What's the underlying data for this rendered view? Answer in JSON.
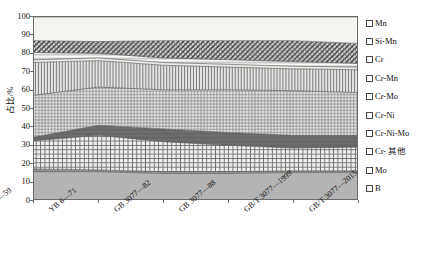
{
  "chart_data": {
    "type": "area",
    "stacked": true,
    "title": "",
    "xlabel": "",
    "ylabel": "占比/%",
    "ylim": [
      0,
      100
    ],
    "yticks": [
      0,
      10,
      20,
      30,
      40,
      50,
      60,
      70,
      80,
      90,
      100
    ],
    "grid": false,
    "legend_position": "right",
    "categories": [
      "YB 6—59",
      "YB 6—71",
      "GB 3077—82",
      "GB 3077—88",
      "GB/T 3077—1999",
      "GB/T 3077—2015"
    ],
    "series": [
      {
        "name": "Mn",
        "values": [
          13.0,
          13.5,
          13.0,
          13.0,
          13.0,
          14.5
        ]
      },
      {
        "name": "Si-Mn",
        "values": [
          6.5,
          6.5,
          9.5,
          10.5,
          11.5,
          11.0
        ]
      },
      {
        "name": "Cr",
        "values": [
          4.0,
          2.5,
          2.5,
          2.5,
          2.5,
          2.0
        ]
      },
      {
        "name": "Cr-Mn",
        "values": [
          1.5,
          1.5,
          1.5,
          1.5,
          1.5,
          1.5
        ]
      },
      {
        "name": "Cr-Mo",
        "values": [
          18.0,
          14.5,
          13.5,
          12.5,
          12.0,
          12.5
        ]
      },
      {
        "name": "Cr-Ni",
        "values": [
          23.0,
          21.0,
          21.5,
          23.5,
          24.5,
          23.5
        ]
      },
      {
        "name": "Cr-Ni-Mo",
        "values": [
          2.0,
          5.5,
          7.0,
          7.0,
          7.0,
          6.5
        ]
      },
      {
        "name": "Cr-其他",
        "values": [
          15.5,
          19.0,
          16.5,
          14.5,
          12.5,
          13.0
        ]
      },
      {
        "name": "Mo",
        "values": [
          1.5,
          1.0,
          1.0,
          1.0,
          1.0,
          1.0
        ]
      },
      {
        "name": "B",
        "values": [
          15.0,
          15.0,
          14.0,
          14.0,
          14.5,
          14.5
        ]
      }
    ],
    "cumulative_tops": {
      "B": [
        15.0,
        15.0,
        14.0,
        14.0,
        14.5,
        14.5
      ],
      "Mo": [
        16.5,
        16.0,
        15.0,
        15.0,
        15.5,
        15.5
      ],
      "Cr-其他": [
        32.0,
        35.0,
        31.5,
        29.5,
        28.0,
        28.5
      ],
      "Cr-Ni-Mo": [
        34.0,
        40.5,
        38.5,
        36.5,
        35.0,
        35.0
      ],
      "Cr-Ni": [
        57.0,
        61.5,
        60.0,
        60.0,
        59.5,
        58.5
      ],
      "Cr-Mo": [
        75.0,
        76.0,
        73.5,
        72.5,
        71.5,
        71.0
      ],
      "Cr-Mn": [
        76.5,
        77.5,
        75.0,
        74.0,
        73.0,
        72.5
      ],
      "Cr": [
        80.5,
        80.0,
        77.5,
        76.5,
        75.5,
        74.5
      ],
      "Si-Mn": [
        87.0,
        86.5,
        87.0,
        87.0,
        87.0,
        85.5
      ],
      "Mn": [
        100.0,
        100.0,
        100.0,
        100.0,
        100.0,
        100.0
      ]
    },
    "legend": [
      {
        "key": "Mn",
        "label": "Mn",
        "swatch": "dots-light"
      },
      {
        "key": "Si-Mn",
        "label": "Si-Mn",
        "swatch": "diagonal-cross-dark"
      },
      {
        "key": "Cr",
        "label": "Cr",
        "swatch": "horizontal-lines"
      },
      {
        "key": "Cr-Mn",
        "label": "Cr-Mn",
        "swatch": "dots-pale"
      },
      {
        "key": "Cr-Mo",
        "label": "Cr-Mo",
        "swatch": "vertical-lines"
      },
      {
        "key": "Cr-Ni",
        "label": "Cr-Ni",
        "swatch": "grid-fine"
      },
      {
        "key": "Cr-Ni-Mo",
        "label": "Cr-Ni-Mo",
        "swatch": "solid-dark"
      },
      {
        "key": "Cr-其他",
        "label": "Cr- 其他",
        "swatch": "grid-coarse"
      },
      {
        "key": "Mo",
        "label": "Mo",
        "swatch": "dots-dense"
      },
      {
        "key": "B",
        "label": "B",
        "swatch": "solid-gray"
      }
    ],
    "colors": {
      "Mn": "#f2f2ef",
      "Si-Mn": "#8a8a8a",
      "Cr": "#e8e8e4",
      "Cr-Mn": "#dedede",
      "Cr-Mo": "#cfcfcf",
      "Cr-Ni": "#c4c4c4",
      "Cr-Ni-Mo": "#6e6e6e",
      "Cr-其他": "#d2d2d2",
      "Mo": "#4a4a4a",
      "B": "#b3b3b3",
      "axis": "#6b6b6b",
      "text": "#111111"
    }
  }
}
